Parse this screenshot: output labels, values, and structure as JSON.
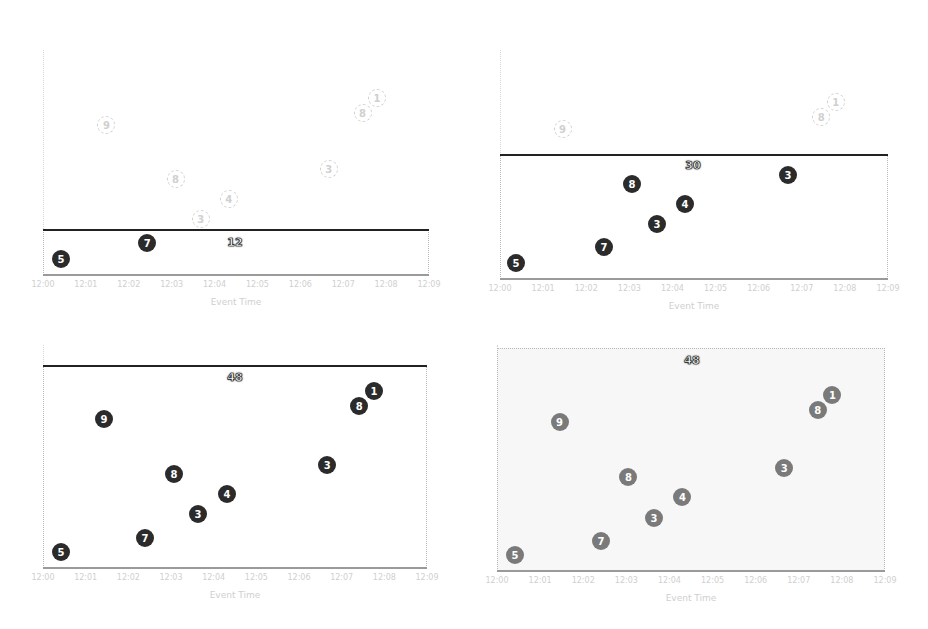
{
  "chart_data": [
    {
      "type": "scatter",
      "title": "",
      "xlabel": "Event Time",
      "ylabel": "",
      "x_ticks": [
        "12:00",
        "12:01",
        "12:02",
        "12:03",
        "12:04",
        "12:05",
        "12:06",
        "12:07",
        "12:08",
        "12:09"
      ],
      "watermark_label": "12",
      "watermark_style": "solid-line",
      "points": [
        {
          "label": "5",
          "x": 0.42,
          "y": 16,
          "state": "included"
        },
        {
          "label": "7",
          "x": 2.43,
          "y": 32,
          "state": "included"
        },
        {
          "label": "9",
          "x": 1.48,
          "y": 150,
          "state": "pending"
        },
        {
          "label": "8",
          "x": 3.09,
          "y": 96,
          "state": "pending"
        },
        {
          "label": "3",
          "x": 3.68,
          "y": 56,
          "state": "pending"
        },
        {
          "label": "4",
          "x": 4.33,
          "y": 76,
          "state": "pending"
        },
        {
          "label": "3",
          "x": 6.66,
          "y": 106,
          "state": "pending"
        },
        {
          "label": "8",
          "x": 7.45,
          "y": 162,
          "state": "pending"
        },
        {
          "label": "1",
          "x": 7.79,
          "y": 177,
          "state": "pending"
        }
      ]
    },
    {
      "type": "scatter",
      "title": "",
      "xlabel": "Event Time",
      "ylabel": "",
      "x_ticks": [
        "12:00",
        "12:01",
        "12:02",
        "12:03",
        "12:04",
        "12:05",
        "12:06",
        "12:07",
        "12:08",
        "12:09"
      ],
      "watermark_label": "30",
      "watermark_style": "solid-line",
      "points": [
        {
          "label": "5",
          "x": 0.37,
          "y": 16,
          "state": "included"
        },
        {
          "label": "7",
          "x": 2.41,
          "y": 32,
          "state": "included"
        },
        {
          "label": "9",
          "x": 1.45,
          "y": 150,
          "state": "pending"
        },
        {
          "label": "8",
          "x": 3.06,
          "y": 95,
          "state": "included"
        },
        {
          "label": "3",
          "x": 3.64,
          "y": 55,
          "state": "included"
        },
        {
          "label": "4",
          "x": 4.29,
          "y": 75,
          "state": "included"
        },
        {
          "label": "3",
          "x": 6.68,
          "y": 104,
          "state": "included"
        },
        {
          "label": "8",
          "x": 7.45,
          "y": 162,
          "state": "pending"
        },
        {
          "label": "1",
          "x": 7.79,
          "y": 177,
          "state": "pending"
        }
      ]
    },
    {
      "type": "scatter",
      "title": "",
      "xlabel": "Event Time",
      "ylabel": "",
      "x_ticks": [
        "12:00",
        "12:01",
        "12:02",
        "12:03",
        "12:04",
        "12:05",
        "12:06",
        "12:07",
        "12:08",
        "12:09"
      ],
      "watermark_label": "48",
      "watermark_style": "solid-line",
      "points": [
        {
          "label": "5",
          "x": 0.42,
          "y": 16,
          "state": "included"
        },
        {
          "label": "7",
          "x": 2.39,
          "y": 30,
          "state": "included"
        },
        {
          "label": "9",
          "x": 1.43,
          "y": 149,
          "state": "included"
        },
        {
          "label": "8",
          "x": 3.07,
          "y": 94,
          "state": "included"
        },
        {
          "label": "3",
          "x": 3.63,
          "y": 54,
          "state": "included"
        },
        {
          "label": "4",
          "x": 4.31,
          "y": 74,
          "state": "included"
        },
        {
          "label": "3",
          "x": 6.66,
          "y": 103,
          "state": "included"
        },
        {
          "label": "8",
          "x": 7.41,
          "y": 162,
          "state": "included"
        },
        {
          "label": "1",
          "x": 7.76,
          "y": 177,
          "state": "included"
        }
      ]
    },
    {
      "type": "scatter",
      "title": "",
      "xlabel": "Event Time",
      "ylabel": "",
      "x_ticks": [
        "12:00",
        "12:01",
        "12:02",
        "12:03",
        "12:04",
        "12:05",
        "12:06",
        "12:07",
        "12:08",
        "12:09"
      ],
      "watermark_label": "48",
      "watermark_style": "dotted-box-shaded",
      "points": [
        {
          "label": "5",
          "x": 0.42,
          "y": 16,
          "state": "emitted"
        },
        {
          "label": "7",
          "x": 2.41,
          "y": 30,
          "state": "emitted"
        },
        {
          "label": "9",
          "x": 1.45,
          "y": 149,
          "state": "emitted"
        },
        {
          "label": "8",
          "x": 3.05,
          "y": 94,
          "state": "emitted"
        },
        {
          "label": "3",
          "x": 3.64,
          "y": 53,
          "state": "emitted"
        },
        {
          "label": "4",
          "x": 4.3,
          "y": 74,
          "state": "emitted"
        },
        {
          "label": "3",
          "x": 6.66,
          "y": 103,
          "state": "emitted"
        },
        {
          "label": "8",
          "x": 7.44,
          "y": 161,
          "state": "emitted"
        },
        {
          "label": "1",
          "x": 7.78,
          "y": 176,
          "state": "emitted"
        }
      ]
    }
  ],
  "panels": [
    {
      "xlabel": "Event Time",
      "watermark": "12"
    },
    {
      "xlabel": "Event Time",
      "watermark": "30"
    },
    {
      "xlabel": "Event Time",
      "watermark": "48"
    },
    {
      "xlabel": "Event Time",
      "watermark": "48"
    }
  ],
  "colors": {
    "included": "#2b2b2b",
    "emitted": "#7a7a7a",
    "pending": "#d0d0d0",
    "watermark_line": "#222222"
  }
}
